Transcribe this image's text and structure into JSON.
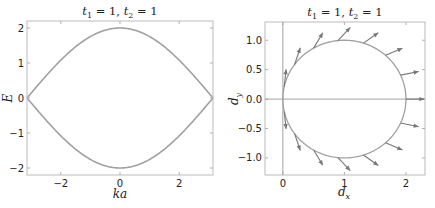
{
  "chart_data": [
    {
      "type": "line",
      "title": "t_1 = 1, t_2 = 1",
      "title_parts": {
        "t1": "t",
        "t1_sub": "1",
        "t1_val": " = 1, ",
        "t2": "t",
        "t2_sub": "2",
        "t2_val": " = 1"
      },
      "xlabel": "ka",
      "ylabel": "E",
      "xlim": [
        -3.14159,
        3.14159
      ],
      "ylim": [
        -2.2,
        2.2
      ],
      "xticks": [
        -2,
        0,
        2
      ],
      "xtick_labels": [
        "−2",
        "0",
        "2"
      ],
      "yticks": [
        -2,
        -1,
        0,
        1,
        2
      ],
      "ytick_labels": [
        "−2",
        "−1",
        "0",
        "1",
        "2"
      ],
      "grid": false,
      "series": [
        {
          "name": "upper band",
          "formula": "E = +sqrt(t1^2 + t2^2 + 2 t1 t2 cos(ka))",
          "x": [
            -3.14159,
            -2.356,
            -1.571,
            -0.785,
            0,
            0.785,
            1.571,
            2.356,
            3.14159
          ],
          "values": [
            0.0,
            0.765,
            1.414,
            1.848,
            2.0,
            1.848,
            1.414,
            0.765,
            0.0
          ]
        },
        {
          "name": "lower band",
          "formula": "E = -sqrt(t1^2 + t2^2 + 2 t1 t2 cos(ka))",
          "x": [
            -3.14159,
            -2.356,
            -1.571,
            -0.785,
            0,
            0.785,
            1.571,
            2.356,
            3.14159
          ],
          "values": [
            0.0,
            -0.765,
            -1.414,
            -1.848,
            -2.0,
            -1.848,
            -1.414,
            -0.765,
            0.0
          ]
        }
      ],
      "colors": {
        "bands": "#a0a0a0"
      }
    },
    {
      "type": "line",
      "subtype": "parametric circle with quiver",
      "title": "t_1 = 1, t_2 = 1",
      "title_parts": {
        "t1": "t",
        "t1_sub": "1",
        "t1_val": " = 1, ",
        "t2": "t",
        "t2_sub": "2",
        "t2_val": " = 1"
      },
      "xlabel": "d_x",
      "ylabel": "d_y",
      "xlabel_parts": {
        "main": "d",
        "sub": "x"
      },
      "ylabel_parts": {
        "main": "d",
        "sub": "y"
      },
      "xlim": [
        -0.29,
        2.31
      ],
      "ylim": [
        -1.29,
        1.31
      ],
      "xticks": [
        0,
        1,
        2
      ],
      "xtick_labels": [
        "0",
        "1",
        "2"
      ],
      "yticks": [
        -1.0,
        -0.5,
        0.0,
        0.5,
        1.0
      ],
      "ytick_labels": [
        "−1.0",
        "−0.5",
        "0.0",
        "0.5",
        "1.0"
      ],
      "grid": false,
      "reference_lines": {
        "vertical_x": 0,
        "horizontal_y": 0
      },
      "series": [
        {
          "name": "d(k) circle",
          "formula": "(1 + cos k, sin k)",
          "center": [
            1,
            0
          ],
          "radius": 1
        }
      ],
      "quiver": {
        "k_values_deg": [
          -168,
          -144,
          -120,
          -96,
          -72,
          -48,
          -24,
          0,
          24,
          48,
          72,
          96,
          120,
          144,
          168
        ],
        "direction": "along d(k), angle k/2",
        "arrow_length": 0.3
      },
      "colors": {
        "circle": "#a0a0a0",
        "arrows": "#777777",
        "ref_lines": "#999999"
      }
    }
  ]
}
